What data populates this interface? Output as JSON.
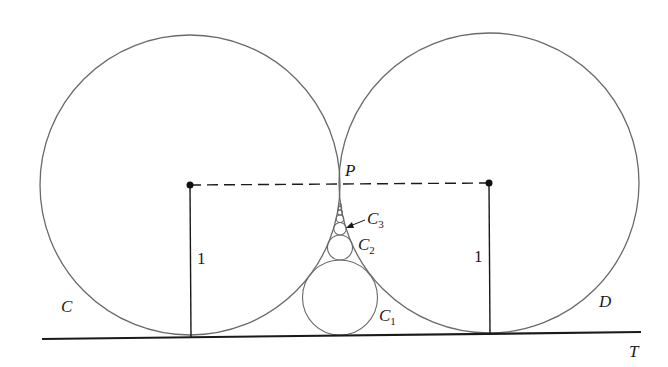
{
  "figure": {
    "colors": {
      "circle": "#6a6a6a",
      "line": "#1a1a1a",
      "dash": "#1a1a1a",
      "point": "#111111"
    },
    "circle_C": {
      "label": "C",
      "cx": 190,
      "cy": 185,
      "r": 150
    },
    "circle_D": {
      "label": "D",
      "cx": 489,
      "cy": 183,
      "r": 150
    },
    "tangent_line": {
      "label": "T",
      "x1": 42,
      "y1": 339,
      "x2": 641,
      "y2": 332
    },
    "point_P": {
      "label": "P"
    },
    "radius_label_left": "1",
    "radius_label_right": "1",
    "chain_circles": [
      {
        "label": "C",
        "sub": "1",
        "cx": 340,
        "cy": 297.5,
        "r": 37.5
      },
      {
        "label": "C",
        "sub": "2",
        "cx": 340,
        "cy": 247.5,
        "r": 12.5
      },
      {
        "label": "C",
        "sub": "3",
        "cx": 340,
        "cy": 228.75,
        "r": 6.25
      },
      {
        "label": "",
        "sub": "",
        "cx": 340,
        "cy": 218.75,
        "r": 3.75
      },
      {
        "label": "",
        "sub": "",
        "cx": 340,
        "cy": 212.5,
        "r": 2.5
      },
      {
        "label": "",
        "sub": "",
        "cx": 340,
        "cy": 208.2,
        "r": 1.79
      },
      {
        "label": "",
        "sub": "",
        "cx": 340,
        "cy": 205.1,
        "r": 1.34
      }
    ]
  }
}
